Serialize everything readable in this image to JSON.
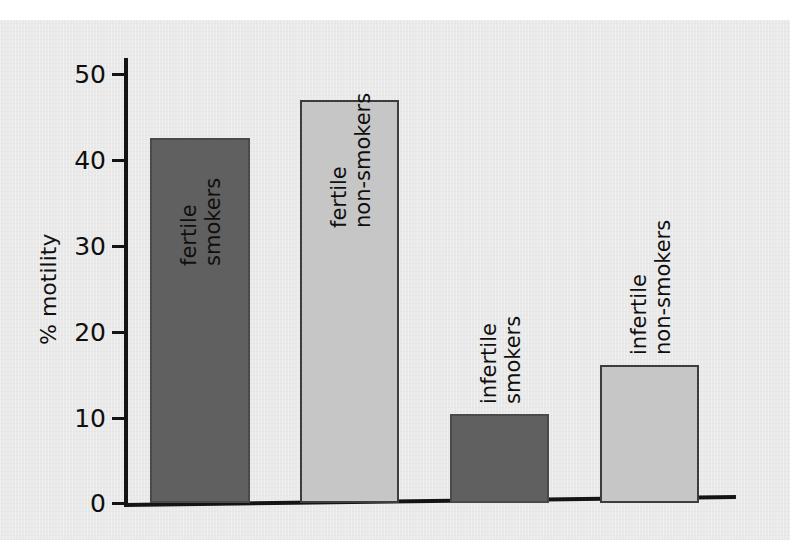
{
  "chart_data": {
    "type": "bar",
    "title": "",
    "subtitle": "",
    "xlabel": "",
    "ylabel": "% motility",
    "ylim": [
      0,
      50
    ],
    "yticks": [
      0,
      10,
      20,
      30,
      40,
      50
    ],
    "ytick_labels": [
      "0",
      "10",
      "20",
      "30",
      "40",
      "50"
    ],
    "grid": false,
    "legend": false,
    "categories": [
      "fertile smokers",
      "fertile non-smokers",
      "infertile smokers",
      "infertile non-smokers"
    ],
    "values": [
      42.4,
      46.9,
      10.4,
      16.0
    ],
    "bar_colors": [
      "#606060",
      "#c6c6c6",
      "#606060",
      "#c6c6c6"
    ],
    "bars": [
      {
        "id": "fertile-smokers",
        "label_lines": [
          "fertile",
          "smokers"
        ],
        "value": 42.4,
        "fill": "#606060",
        "style": "dark",
        "label_position": "inside-top"
      },
      {
        "id": "fertile-non-smokers",
        "label_lines": [
          "fertile",
          "non-smokers"
        ],
        "value": 46.9,
        "fill": "#c6c6c6",
        "style": "light",
        "label_position": "inside-top"
      },
      {
        "id": "infertile-smokers",
        "label_lines": [
          "infertile",
          "smokers"
        ],
        "value": 10.4,
        "fill": "#606060",
        "style": "dark",
        "label_position": "above"
      },
      {
        "id": "infertile-non-smokers",
        "label_lines": [
          "infertile",
          "non-smokers"
        ],
        "value": 16.0,
        "fill": "#c6c6c6",
        "style": "light",
        "label_position": "above"
      }
    ]
  },
  "axis": {
    "y_title": "% motility",
    "tick_50": "50",
    "tick_40": "40",
    "tick_30": "30",
    "tick_20": "20",
    "tick_10": "10",
    "tick_0": "0"
  },
  "labels": {
    "b1_l1": "fertile",
    "b1_l2": "smokers",
    "b2_l1": "fertile",
    "b2_l2": "non-smokers",
    "b3_l1": "infertile",
    "b3_l2": "smokers",
    "b4_l1": "infertile",
    "b4_l2": "non-smokers"
  },
  "colors": {
    "paper": "#e9e9e9",
    "ink": "#141414",
    "bar_dark": "#606060",
    "bar_light": "#c6c6c6"
  }
}
